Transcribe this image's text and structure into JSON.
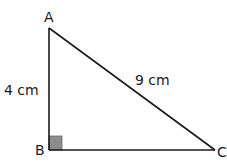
{
  "diagram": {
    "type": "right-triangle",
    "vertices": [
      {
        "name": "A",
        "x": 49,
        "y": 28
      },
      {
        "name": "B",
        "x": 49,
        "y": 150
      },
      {
        "name": "C",
        "x": 215,
        "y": 150
      }
    ],
    "right_angle_at": "B",
    "sides": [
      {
        "from": "A",
        "to": "B",
        "label": "4 cm"
      },
      {
        "from": "A",
        "to": "C",
        "label": "9 cm"
      },
      {
        "from": "B",
        "to": "C",
        "label": ""
      }
    ],
    "colors": {
      "line": "#1a1a1a",
      "right_angle_marker": "#8c8c8c",
      "background": "#ffffff"
    }
  },
  "labels": {
    "vertex_a": "A",
    "vertex_b": "B",
    "vertex_c": "C",
    "side_ab": "4 cm",
    "side_ac": "9 cm"
  }
}
